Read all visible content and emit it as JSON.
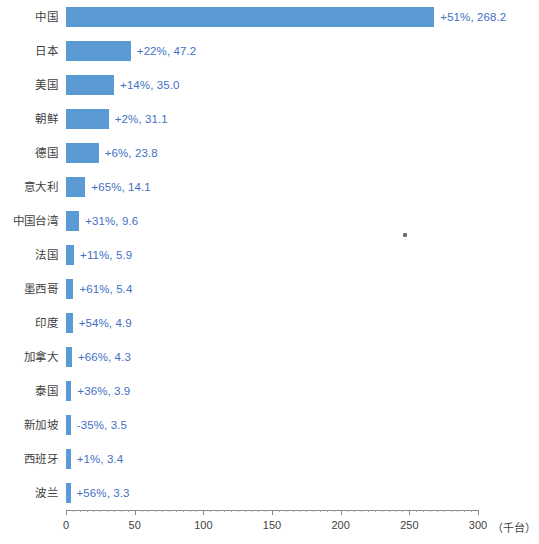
{
  "chart_data": {
    "type": "bar",
    "orientation": "horizontal",
    "title": "",
    "xlabel": "（千台）",
    "ylabel": "",
    "xlim": [
      0,
      300
    ],
    "xticks": [
      0,
      50,
      100,
      150,
      200,
      250,
      300
    ],
    "xtick_labels": [
      "0",
      "50",
      "100",
      "150",
      "200",
      "250",
      "300"
    ],
    "grid": false,
    "legend": false,
    "bar_color": "#5b9bd5",
    "label_color": "#3f6fc4",
    "categories": [
      "中国",
      "日本",
      "美国",
      "朝鲜",
      "德国",
      "意大利",
      "中国台湾",
      "法国",
      "墨西哥",
      "印度",
      "加拿大",
      "泰国",
      "新加坡",
      "西班牙",
      "波兰"
    ],
    "values": [
      268.2,
      47.2,
      35.0,
      31.1,
      23.8,
      14.1,
      9.6,
      5.9,
      5.4,
      4.9,
      4.3,
      3.9,
      3.5,
      3.4,
      3.3
    ],
    "growth": [
      "+51%",
      "+22%",
      "+14%",
      "+2%",
      "+6%",
      "+65%",
      "+31%",
      "+11%",
      "+61%",
      "+54%",
      "+66%",
      "+36%",
      "-35%",
      "+1%",
      "+56%"
    ],
    "data_labels": [
      "+51%, 268.2",
      "+22%, 47.2",
      "+14%, 35.0",
      "+2%, 31.1",
      "+6%, 23.8",
      "+65%, 14.1",
      "+31%, 9.6",
      "+11%, 5.9",
      "+61%, 5.4",
      "+54%, 4.9",
      "+66%, 4.3",
      "+36%, 3.9",
      "-35%, 3.5",
      "+1%, 3.4",
      "+56%, 3.3"
    ]
  },
  "axis": {
    "unit_label": "（千台）"
  }
}
